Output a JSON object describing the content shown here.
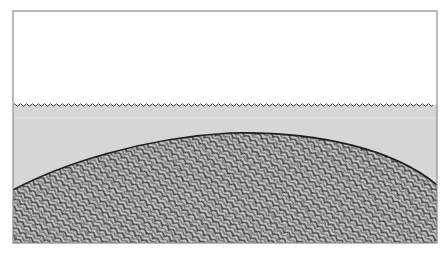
{
  "diagram": {
    "type": "cross-section illustration",
    "layers": [
      {
        "name": "air",
        "color": "#ffffff"
      },
      {
        "name": "water",
        "color": "#d6d6d6"
      },
      {
        "name": "stippled-mound",
        "color": "#9a9a9a"
      }
    ],
    "frame": {
      "x": 13,
      "y": 11,
      "width": 424,
      "height": 232,
      "stroke": "#8c8c8c"
    },
    "water_surface_y": 105,
    "mound_profile": {
      "left_y": 190,
      "peak_x": 230,
      "peak_y": 133,
      "right_y": 185
    }
  }
}
